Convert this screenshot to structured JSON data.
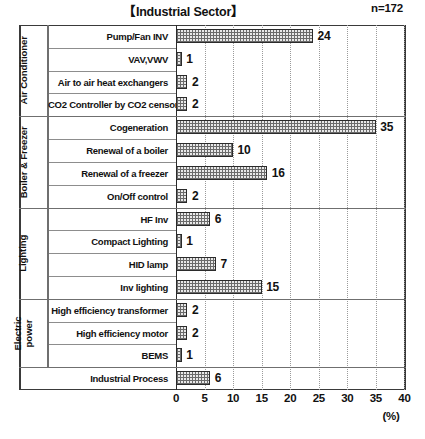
{
  "header": {
    "title": "【Industrial Sector】",
    "sample_size": "n=172"
  },
  "axis": {
    "unit": "(%)",
    "ticks": [
      "0",
      "5",
      "10",
      "15",
      "20",
      "25",
      "30",
      "35",
      "40"
    ]
  },
  "groups": [
    {
      "label": "Air Conditioner",
      "rows": 4
    },
    {
      "label": "Boiler & Freezer",
      "rows": 4
    },
    {
      "label": "Lighting",
      "rows": 4
    },
    {
      "label": "Electric power",
      "rows": 3
    },
    {
      "label": "",
      "rows": 1
    }
  ],
  "chart_data": {
    "type": "bar",
    "orientation": "horizontal",
    "title": "【Industrial Sector】",
    "annotation": "n=172",
    "xlabel": "(%)",
    "ylabel": "",
    "xlim": [
      0,
      40
    ],
    "xticks": [
      0,
      5,
      10,
      15,
      20,
      25,
      30,
      35,
      40
    ],
    "grid": "vertical-dotted",
    "legend": "none",
    "categories": [
      "Pump/Fan INV",
      "VAV,VWV",
      "Air to air heat exchangers",
      "CO2 Controller by CO2 censor",
      "Cogeneration",
      "Renewal of a boiler",
      "Renewal of a freezer",
      "On/Off control",
      "HF Inv",
      "Compact Lighting",
      "HID lamp",
      "Inv lighting",
      "High efficiency transformer",
      "High efficiency motor",
      "BEMS",
      "Industrial Process"
    ],
    "values": [
      24,
      1,
      2,
      2,
      35,
      10,
      16,
      2,
      6,
      1,
      7,
      15,
      2,
      2,
      1,
      6
    ],
    "value_labels": [
      "24",
      "1",
      "2",
      "2",
      "35",
      "10",
      "16",
      "2",
      "6",
      "1",
      "7",
      "15",
      "2",
      "2",
      "1",
      "6"
    ],
    "category_groups": [
      "Air Conditioner",
      "Air Conditioner",
      "Air Conditioner",
      "Air Conditioner",
      "Boiler & Freezer",
      "Boiler & Freezer",
      "Boiler & Freezer",
      "Boiler & Freezer",
      "Lighting",
      "Lighting",
      "Lighting",
      "Lighting",
      "Electric power",
      "Electric power",
      "Electric power",
      ""
    ]
  }
}
